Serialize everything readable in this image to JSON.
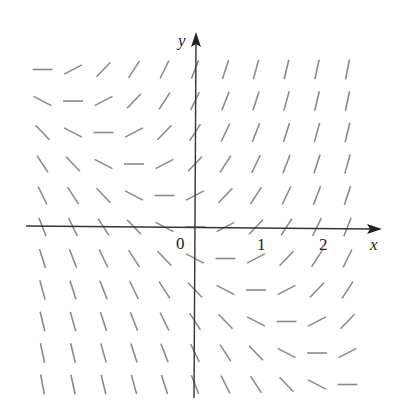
{
  "diagram": {
    "type": "slope-field",
    "axes": {
      "x_label": "x",
      "y_label": "y",
      "origin_label": "0",
      "x_ticks": [
        {
          "value": 1,
          "label": "1"
        },
        {
          "value": 2,
          "label": "2"
        }
      ]
    },
    "grid": {
      "x_values": [
        -2.5,
        -2,
        -1.5,
        -1,
        -0.5,
        0,
        0.5,
        1,
        1.5,
        2,
        2.5
      ],
      "y_values": [
        2.5,
        2,
        1.5,
        1,
        0.5,
        0,
        -0.5,
        -1,
        -1.5,
        -2,
        -2.5
      ],
      "slope_function": "x + y"
    },
    "colors": {
      "segment": "#8a8a8a",
      "axis": "#333333",
      "background": "#ffffff"
    }
  }
}
